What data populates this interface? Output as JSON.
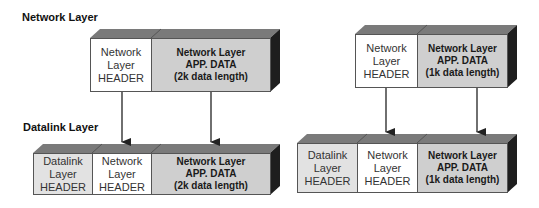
{
  "labels": {
    "network_layer": "Network Layer",
    "datalink_layer": "Datalink Layer"
  },
  "left": {
    "network_packet": {
      "header": "Network\nLayer\nHEADER",
      "data": "Network Layer\nAPP. DATA\n(2k data length)"
    },
    "datalink_frame": {
      "datalink_header": "Datalink\nLayer\nHEADER",
      "network_header": "Network\nLayer\nHEADER",
      "data": "Network Layer\nAPP. DATA\n(2k data length)"
    }
  },
  "right": {
    "network_packet": {
      "header": "Network\nLayer\nHEADER",
      "data": "Network Layer\nAPP. DATA\n(1k data length)"
    },
    "datalink_frame": {
      "datalink_header": "Datalink\nLayer\nHEADER",
      "network_header": "Network\nLayer\nHEADER",
      "data": "Network Layer\nAPP. DATA\n(1k data length)"
    }
  },
  "colors": {
    "top_face": "#7a7a7a",
    "side_face": "#1e1e1e",
    "header_fill": "#ffffff",
    "datalink_fill": "#e2e2e2",
    "data_fill": "#cfcfcf"
  }
}
